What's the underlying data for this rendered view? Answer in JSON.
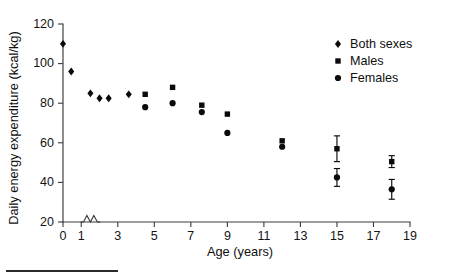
{
  "chart_data": {
    "type": "scatter",
    "title": "",
    "xlabel": "Age (years)",
    "ylabel": "Daily energy expenditure (kcal/kg)",
    "xlim": [
      0,
      19
    ],
    "ylim": [
      20,
      120
    ],
    "xticks": [
      0,
      1,
      3,
      5,
      7,
      9,
      11,
      13,
      15,
      17,
      19
    ],
    "xtick_labels": [
      "0",
      "1",
      "3",
      "5",
      "7",
      "9",
      "11",
      "13",
      "15",
      "17",
      "19"
    ],
    "yticks": [
      20,
      40,
      60,
      80,
      100,
      120
    ],
    "ytick_labels": [
      "20",
      "40",
      "60",
      "80",
      "100",
      "120"
    ],
    "grid": false,
    "axis_break": {
      "axis": "x",
      "between": [
        1,
        2
      ],
      "style": "zigzag"
    },
    "legend_position": "top-right",
    "series": [
      {
        "name": "Both sexes",
        "marker": "diamond",
        "color": "#0a0a0a",
        "points": [
          {
            "x": 0.0,
            "y": 110.0
          },
          {
            "x": 0.45,
            "y": 96.0
          },
          {
            "x": 1.5,
            "y": 85.0
          },
          {
            "x": 2.0,
            "y": 82.5
          },
          {
            "x": 2.5,
            "y": 82.5
          },
          {
            "x": 3.6,
            "y": 84.5
          }
        ]
      },
      {
        "name": "Males",
        "marker": "square",
        "color": "#0a0a0a",
        "points": [
          {
            "x": 4.5,
            "y": 84.5,
            "err": null
          },
          {
            "x": 6.0,
            "y": 88.0,
            "err": null
          },
          {
            "x": 7.6,
            "y": 79.0,
            "err": null
          },
          {
            "x": 9.0,
            "y": 74.5,
            "err": null
          },
          {
            "x": 12.0,
            "y": 61.0,
            "err": null
          },
          {
            "x": 15.0,
            "y": 57.0,
            "err": 6.5
          },
          {
            "x": 18.0,
            "y": 50.5,
            "err": 3.0
          }
        ]
      },
      {
        "name": "Females",
        "marker": "circle",
        "color": "#0a0a0a",
        "points": [
          {
            "x": 4.5,
            "y": 78.0,
            "err": null
          },
          {
            "x": 6.0,
            "y": 80.0,
            "err": null
          },
          {
            "x": 7.6,
            "y": 75.5,
            "err": null
          },
          {
            "x": 9.0,
            "y": 65.0,
            "err": null
          },
          {
            "x": 12.0,
            "y": 58.0,
            "err": null
          },
          {
            "x": 15.0,
            "y": 42.5,
            "err": 4.5
          },
          {
            "x": 18.0,
            "y": 36.5,
            "err": 5.0
          }
        ]
      }
    ]
  },
  "legend": {
    "entries": [
      {
        "label": "Both sexes",
        "marker": "diamond"
      },
      {
        "label": "Males",
        "marker": "square"
      },
      {
        "label": "Females",
        "marker": "circle"
      }
    ]
  }
}
